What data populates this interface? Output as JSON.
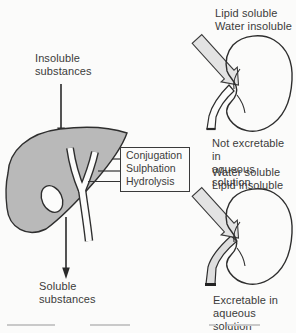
{
  "labels": {
    "insoluble": "Insoluble\nsubstances",
    "soluble": "Soluble\nsubstances",
    "lipid_top": "Lipid soluble\nWater insoluble",
    "not_excretable": "Not excretable in\naqueous solution",
    "water_mid": "Water soluble\nLipid insoluble",
    "excretable": "Excretable in\naqueous solution"
  },
  "process_box": {
    "items": [
      "Conjugation",
      "Sulphation",
      "Hydrolysis"
    ]
  },
  "colors": {
    "liver_fill": "#b9b9b9",
    "flow_band_fill": "#e3e3e3",
    "excreted_fill": "#dedede",
    "ink": "#2e2e2e",
    "text": "#3b3b3b",
    "background": "#fbfbfa"
  }
}
